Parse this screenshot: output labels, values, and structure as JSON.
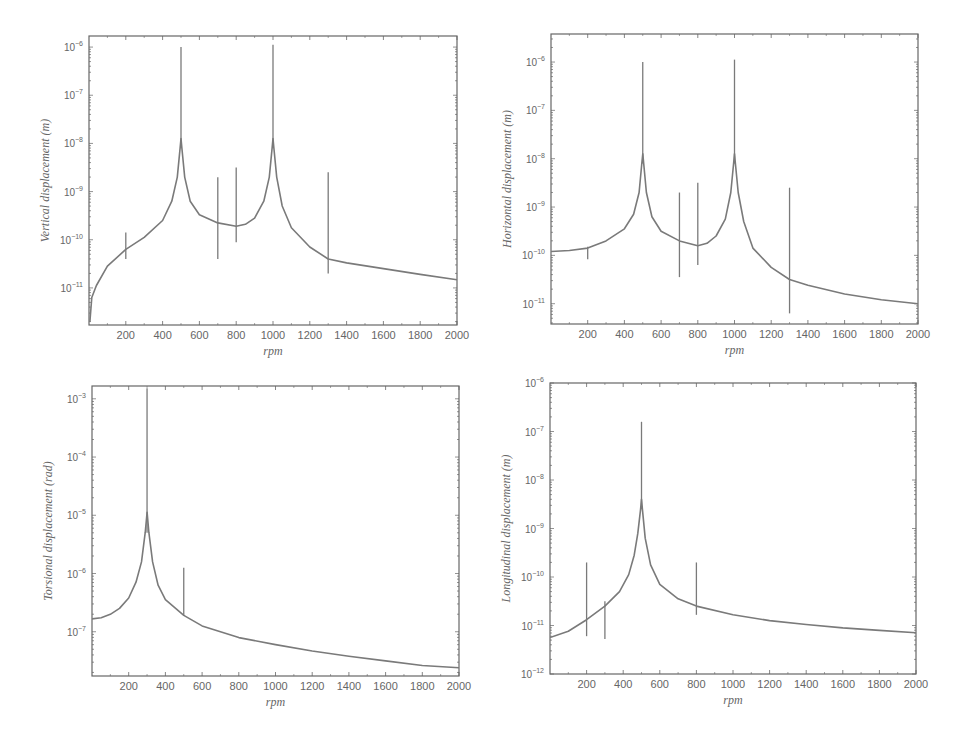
{
  "figure": {
    "line_color": "#7a7a7a",
    "frame_color": "#666666",
    "background": "#ffffff"
  },
  "chart_data": [
    {
      "id": "vertical",
      "type": "line",
      "title": "",
      "xlabel": "rpm",
      "ylabel": "Vertical displacement (m)",
      "yscale": "log",
      "xlim": [
        0,
        2000
      ],
      "ylim_exp": [
        -11.77,
        -5.77
      ],
      "x_ticks": [
        200,
        400,
        600,
        800,
        1000,
        1200,
        1400,
        1600,
        1800,
        2000
      ],
      "y_ticks_exp": [
        -6,
        -7,
        -8,
        -9,
        -10,
        -11
      ],
      "frame": {
        "x0": 89,
        "y0": 36,
        "x1": 457,
        "y1": 325
      },
      "baseline": [
        [
          5,
          -11.7
        ],
        [
          15,
          -11.2
        ],
        [
          40,
          -10.95
        ],
        [
          100,
          -10.55
        ],
        [
          200,
          -10.2
        ],
        [
          300,
          -9.95
        ],
        [
          400,
          -9.6
        ],
        [
          450,
          -9.2
        ],
        [
          480,
          -8.7
        ],
        [
          495,
          -8.1
        ],
        [
          500,
          -7.9
        ],
        [
          505,
          -8.1
        ],
        [
          520,
          -8.7
        ],
        [
          550,
          -9.2
        ],
        [
          600,
          -9.48
        ],
        [
          700,
          -9.65
        ],
        [
          800,
          -9.72
        ],
        [
          850,
          -9.68
        ],
        [
          900,
          -9.55
        ],
        [
          950,
          -9.2
        ],
        [
          980,
          -8.7
        ],
        [
          995,
          -8.1
        ],
        [
          1000,
          -7.9
        ],
        [
          1005,
          -8.1
        ],
        [
          1020,
          -8.7
        ],
        [
          1050,
          -9.3
        ],
        [
          1100,
          -9.75
        ],
        [
          1200,
          -10.15
        ],
        [
          1300,
          -10.4
        ],
        [
          1400,
          -10.48
        ],
        [
          1600,
          -10.6
        ],
        [
          1800,
          -10.72
        ],
        [
          2000,
          -10.83
        ]
      ],
      "spikes": [
        {
          "x": 200,
          "y_top": -9.85,
          "y_bottom": -10.4
        },
        {
          "x": 500,
          "y_top": -6.0,
          "y_bottom": -8.1
        },
        {
          "x": 700,
          "y_top": -8.7,
          "y_bottom": -10.4
        },
        {
          "x": 800,
          "y_top": -8.5,
          "y_bottom": -10.05
        },
        {
          "x": 1000,
          "y_top": -5.95,
          "y_bottom": -8.1
        },
        {
          "x": 1300,
          "y_top": -8.6,
          "y_bottom": -10.7
        }
      ]
    },
    {
      "id": "horizontal",
      "type": "line",
      "title": "",
      "xlabel": "rpm",
      "ylabel": "Horizontal displacement (m)",
      "yscale": "log",
      "xlim": [
        0,
        2000
      ],
      "ylim_exp": [
        -11.42,
        -5.42
      ],
      "x_ticks": [
        200,
        400,
        600,
        800,
        1000,
        1200,
        1400,
        1600,
        1800,
        2000
      ],
      "y_ticks_exp": [
        -6,
        -7,
        -8,
        -9,
        -10,
        -11
      ],
      "frame": {
        "x0": 551,
        "y0": 34,
        "x1": 918,
        "y1": 324
      },
      "baseline": [
        [
          0,
          -9.92
        ],
        [
          100,
          -9.9
        ],
        [
          200,
          -9.85
        ],
        [
          300,
          -9.7
        ],
        [
          400,
          -9.45
        ],
        [
          450,
          -9.15
        ],
        [
          480,
          -8.7
        ],
        [
          495,
          -8.1
        ],
        [
          500,
          -7.9
        ],
        [
          505,
          -8.1
        ],
        [
          520,
          -8.7
        ],
        [
          550,
          -9.2
        ],
        [
          600,
          -9.5
        ],
        [
          700,
          -9.7
        ],
        [
          800,
          -9.8
        ],
        [
          850,
          -9.75
        ],
        [
          900,
          -9.6
        ],
        [
          950,
          -9.25
        ],
        [
          980,
          -8.7
        ],
        [
          995,
          -8.1
        ],
        [
          1000,
          -7.9
        ],
        [
          1005,
          -8.1
        ],
        [
          1020,
          -8.7
        ],
        [
          1050,
          -9.3
        ],
        [
          1100,
          -9.85
        ],
        [
          1200,
          -10.25
        ],
        [
          1300,
          -10.5
        ],
        [
          1400,
          -10.62
        ],
        [
          1600,
          -10.8
        ],
        [
          1800,
          -10.92
        ],
        [
          2000,
          -11.0
        ]
      ],
      "spikes": [
        {
          "x": 200,
          "y_top": -9.82,
          "y_bottom": -10.08
        },
        {
          "x": 500,
          "y_top": -6.0,
          "y_bottom": -8.1
        },
        {
          "x": 700,
          "y_top": -8.7,
          "y_bottom": -10.45
        },
        {
          "x": 800,
          "y_top": -8.5,
          "y_bottom": -10.2
        },
        {
          "x": 1000,
          "y_top": -5.95,
          "y_bottom": -8.1
        },
        {
          "x": 1300,
          "y_top": -8.6,
          "y_bottom": -11.2
        }
      ]
    },
    {
      "id": "torsional",
      "type": "line",
      "title": "",
      "xlabel": "rpm",
      "ylabel": "Torsional displacement (rad)",
      "yscale": "log",
      "xlim": [
        0,
        2000
      ],
      "ylim_exp": [
        -7.76,
        -2.78
      ],
      "x_ticks": [
        200,
        400,
        600,
        800,
        1000,
        1200,
        1400,
        1600,
        1800,
        2000
      ],
      "y_ticks_exp": [
        -3,
        -4,
        -5,
        -6,
        -7
      ],
      "frame": {
        "x0": 92,
        "y0": 386,
        "x1": 459,
        "y1": 676
      },
      "baseline": [
        [
          0,
          -6.78
        ],
        [
          50,
          -6.76
        ],
        [
          100,
          -6.7
        ],
        [
          150,
          -6.6
        ],
        [
          200,
          -6.42
        ],
        [
          240,
          -6.15
        ],
        [
          270,
          -5.8
        ],
        [
          290,
          -5.3
        ],
        [
          300,
          -4.95
        ],
        [
          310,
          -5.3
        ],
        [
          330,
          -5.8
        ],
        [
          360,
          -6.2
        ],
        [
          400,
          -6.45
        ],
        [
          500,
          -6.72
        ],
        [
          600,
          -6.9
        ],
        [
          800,
          -7.1
        ],
        [
          1000,
          -7.22
        ],
        [
          1200,
          -7.33
        ],
        [
          1400,
          -7.42
        ],
        [
          1600,
          -7.5
        ],
        [
          1800,
          -7.58
        ],
        [
          2000,
          -7.62
        ]
      ],
      "spikes": [
        {
          "x": 300,
          "y_top": -2.82,
          "y_bottom": -5.3
        },
        {
          "x": 500,
          "y_top": -5.9,
          "y_bottom": -6.72
        }
      ]
    },
    {
      "id": "longitudinal",
      "type": "line",
      "title": "",
      "xlabel": "rpm",
      "ylabel": "Longitudinal displacement (m)",
      "yscale": "log",
      "xlim": [
        0,
        2000
      ],
      "ylim_exp": [
        -12,
        -6
      ],
      "x_ticks": [
        200,
        400,
        600,
        800,
        1000,
        1200,
        1400,
        1600,
        1800,
        2000
      ],
      "y_ticks_exp": [
        -6,
        -7,
        -8,
        -9,
        -10,
        -11,
        -12
      ],
      "frame": {
        "x0": 550,
        "y0": 383,
        "x1": 916,
        "y1": 674
      },
      "baseline": [
        [
          0,
          -11.25
        ],
        [
          100,
          -11.12
        ],
        [
          200,
          -10.88
        ],
        [
          300,
          -10.6
        ],
        [
          380,
          -10.3
        ],
        [
          430,
          -9.95
        ],
        [
          460,
          -9.55
        ],
        [
          480,
          -9.1
        ],
        [
          495,
          -8.6
        ],
        [
          500,
          -8.4
        ],
        [
          505,
          -8.6
        ],
        [
          520,
          -9.2
        ],
        [
          550,
          -9.75
        ],
        [
          600,
          -10.15
        ],
        [
          700,
          -10.45
        ],
        [
          800,
          -10.6
        ],
        [
          1000,
          -10.78
        ],
        [
          1200,
          -10.9
        ],
        [
          1400,
          -10.98
        ],
        [
          1600,
          -11.05
        ],
        [
          1800,
          -11.1
        ],
        [
          2000,
          -11.15
        ]
      ],
      "spikes": [
        {
          "x": 200,
          "y_top": -9.7,
          "y_bottom": -11.22
        },
        {
          "x": 300,
          "y_top": -10.5,
          "y_bottom": -11.28
        },
        {
          "x": 500,
          "y_top": -6.8,
          "y_bottom": -8.6
        },
        {
          "x": 800,
          "y_top": -9.7,
          "y_bottom": -10.78
        }
      ]
    }
  ]
}
